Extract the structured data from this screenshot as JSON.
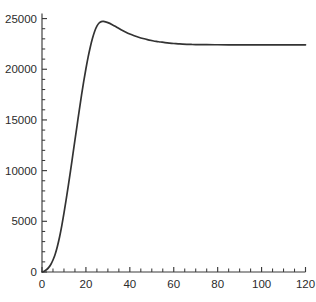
{
  "chart_data": {
    "type": "line",
    "title": "",
    "subtitle": "",
    "xlabel": "",
    "ylabel": "",
    "xlim": [
      0,
      120
    ],
    "ylim": [
      0,
      25500
    ],
    "grid": false,
    "legend": null,
    "legend_position": "none",
    "x_ticks_major": [
      0,
      20,
      40,
      60,
      80,
      100,
      120
    ],
    "x_tick_labels": [
      "0",
      "20",
      "40",
      "60",
      "80",
      "100",
      "120"
    ],
    "x_tick_minor_step": 5,
    "y_ticks_major": [
      0,
      5000,
      10000,
      15000,
      20000,
      25000
    ],
    "y_tick_labels": [
      "0",
      "5000",
      "10000",
      "15000",
      "20000",
      "25000"
    ],
    "y_tick_minor_step": 1000,
    "series": [
      {
        "name": "curve",
        "color": "#333333",
        "x": [
          0,
          1,
          2,
          3,
          4,
          5,
          6,
          7,
          8,
          9,
          10,
          11,
          12,
          13,
          14,
          15,
          16,
          17,
          18,
          19,
          20,
          21,
          22,
          23,
          24,
          25,
          26,
          27,
          28,
          30,
          32,
          34,
          36,
          38,
          40,
          42,
          44,
          46,
          48,
          50,
          52,
          54,
          56,
          58,
          60,
          62,
          64,
          66,
          68,
          70,
          75,
          80,
          85,
          90,
          95,
          100,
          105,
          110,
          115,
          120
        ],
        "y": [
          0,
          80,
          220,
          430,
          740,
          1180,
          1760,
          2520,
          3450,
          4550,
          5800,
          7150,
          8550,
          10000,
          11500,
          13000,
          14500,
          16000,
          17450,
          18800,
          20050,
          21200,
          22200,
          23050,
          23750,
          24250,
          24560,
          24700,
          24720,
          24600,
          24400,
          24150,
          23900,
          23680,
          23480,
          23310,
          23160,
          23030,
          22920,
          22830,
          22750,
          22690,
          22630,
          22580,
          22540,
          22510,
          22480,
          22460,
          22445,
          22435,
          22420,
          22415,
          22412,
          22410,
          22410,
          22410,
          22410,
          22410,
          22410,
          22410
        ]
      }
    ],
    "annotations": [],
    "peak": {
      "x": 24,
      "y": 24720
    },
    "plateau_value": 22410
  },
  "axes": {
    "x_axis_name": "x-axis",
    "y_axis_name": "y-axis"
  }
}
